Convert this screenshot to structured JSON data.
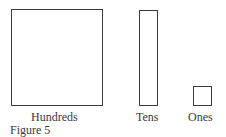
{
  "figure": {
    "caption": "Figure 5",
    "blocks": [
      {
        "name": "hundreds",
        "label": "Hundreds"
      },
      {
        "name": "tens",
        "label": "Tens"
      },
      {
        "name": "ones",
        "label": "Ones"
      }
    ]
  }
}
